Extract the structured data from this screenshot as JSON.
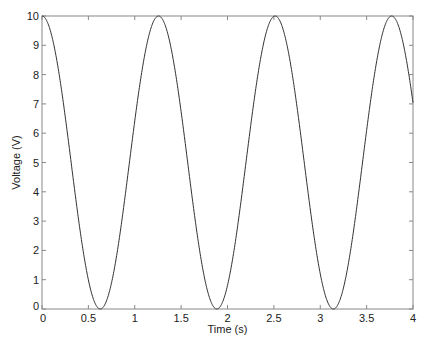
{
  "chart_data": {
    "type": "line",
    "title": "",
    "xlabel": "Time (s)",
    "ylabel": "Voltage (V)",
    "xlim": [
      0,
      4
    ],
    "ylim": [
      0,
      10
    ],
    "xticks": [
      0,
      0.5,
      1,
      1.5,
      2,
      2.5,
      3,
      3.5,
      4
    ],
    "xtick_labels": [
      "0",
      "0.5",
      "1",
      "1.5",
      "2",
      "2.5",
      "3",
      "3.5",
      "4"
    ],
    "yticks": [
      0,
      1,
      2,
      3,
      4,
      5,
      6,
      7,
      8,
      9,
      10
    ],
    "ytick_labels": [
      "0",
      "1",
      "2",
      "3",
      "4",
      "5",
      "6",
      "7",
      "8",
      "9",
      "10"
    ],
    "grid": false,
    "legend": null,
    "series": [
      {
        "name": "Voltage",
        "formula": "V(t) = 5 + 5*cos(5t)",
        "color": "#333333",
        "x": [
          0,
          0.2,
          0.4,
          0.628,
          0.8,
          1.0,
          1.257,
          1.5,
          1.7,
          1.885,
          2.1,
          2.3,
          2.513,
          2.7,
          2.9,
          3.142,
          3.4,
          3.6,
          3.77,
          3.9,
          4.0
        ],
        "values": [
          10,
          7.7,
          2.08,
          0,
          1.73,
          8.55,
          10,
          6.69,
          0.43,
          0,
          2.43,
          6.41,
          10,
          7.99,
          0.41,
          0,
          3.07,
          7.48,
          10,
          8.24,
          7.04
        ]
      }
    ]
  },
  "plot_area": {
    "left": 42,
    "top": 16,
    "right": 413,
    "bottom": 309
  },
  "colors": {
    "line": "#333333",
    "axis": "#888888",
    "text": "#222222"
  }
}
